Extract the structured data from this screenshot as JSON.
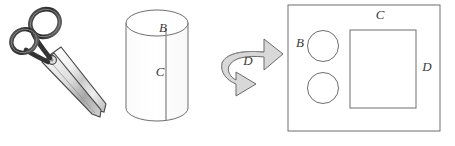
{
  "figure": {
    "background_color": "#ffffff",
    "stroke_color": "#6e6e6e",
    "label_color": "#3a3a3a",
    "arrow_fill": "#d8d8d8",
    "panels": [
      {
        "name": "scissors",
        "kind": "illustration",
        "description": "pair of scissors angled diagonally"
      },
      {
        "name": "cylinder",
        "kind": "shape",
        "labels": [
          {
            "text": "B",
            "location": "top-face"
          },
          {
            "text": "C",
            "location": "side-center"
          }
        ]
      },
      {
        "name": "rotation-arrow",
        "kind": "arrow",
        "labels": [
          {
            "text": "D",
            "location": "arrow-center"
          }
        ]
      },
      {
        "name": "result-panel",
        "kind": "plan-view",
        "labels": [
          {
            "text": "B",
            "location": "left-of-circles"
          },
          {
            "text": "C",
            "location": "top-edge"
          },
          {
            "text": "D",
            "location": "right-edge"
          }
        ],
        "shapes": [
          {
            "type": "circle",
            "name": "circle-top"
          },
          {
            "type": "circle",
            "name": "circle-bottom"
          },
          {
            "type": "rect",
            "name": "inner-rectangle"
          }
        ]
      }
    ],
    "labels": {
      "cylinder_b": "B",
      "cylinder_c": "C",
      "arrow_d": "D",
      "panel_b": "B",
      "panel_c": "C",
      "panel_d": "D"
    }
  }
}
